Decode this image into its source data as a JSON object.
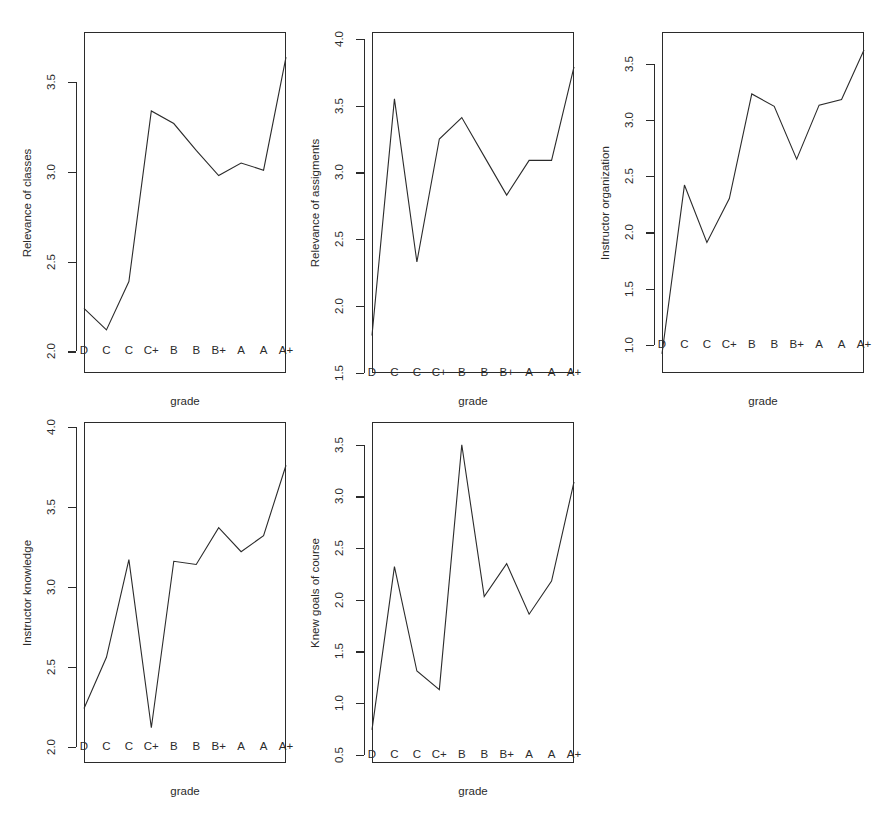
{
  "figure": {
    "background_color": "#ffffff",
    "line_color": "#2b2b2b",
    "axis_color": "#2b2b2b",
    "layout": "3 columns x 2 rows, 5 panels used, bottom-right empty"
  },
  "chart_data": [
    {
      "type": "line",
      "panel": 1,
      "title": "",
      "xlabel": "grade",
      "ylabel": "Relevance of classes",
      "categories": [
        "D",
        "C",
        "C",
        "C+",
        "B",
        "B",
        "B+",
        "A",
        "A",
        "A+"
      ],
      "values": [
        2.24,
        2.12,
        2.39,
        3.34,
        3.27,
        3.12,
        2.98,
        3.05,
        3.01,
        3.64
      ],
      "yticks": [
        "2.0",
        "2.5",
        "3.0",
        "3.5"
      ],
      "ytick_values": [
        2.0,
        2.5,
        3.0,
        3.5
      ],
      "ylim": [
        1.88,
        3.78
      ],
      "grid": false,
      "legend": "none"
    },
    {
      "type": "line",
      "panel": 2,
      "title": "",
      "xlabel": "grade",
      "ylabel": "Relevance of assigments",
      "categories": [
        "D",
        "C",
        "C",
        "C+",
        "B",
        "B",
        "B+",
        "A",
        "A",
        "A+"
      ],
      "values": [
        1.78,
        3.55,
        2.33,
        3.25,
        3.41,
        3.12,
        2.83,
        3.09,
        3.09,
        3.79
      ],
      "yticks": [
        "1.5",
        "2.0",
        "2.5",
        "3.0",
        "3.5",
        "4.0"
      ],
      "ytick_values": [
        1.5,
        2.0,
        2.5,
        3.0,
        3.5,
        4.0
      ],
      "ylim": [
        1.5,
        4.05
      ],
      "grid": false,
      "legend": "none"
    },
    {
      "type": "line",
      "panel": 3,
      "title": "",
      "xlabel": "grade",
      "ylabel": "Instructor organization",
      "categories": [
        "D",
        "C",
        "C",
        "C+",
        "B",
        "B",
        "B+",
        "A",
        "A",
        "A+"
      ],
      "values": [
        0.92,
        2.42,
        1.91,
        2.3,
        3.23,
        3.12,
        2.65,
        3.13,
        3.18,
        3.62
      ],
      "yticks": [
        "1.0",
        "1.5",
        "2.0",
        "2.5",
        "3.0",
        "3.5"
      ],
      "ytick_values": [
        1.0,
        1.5,
        2.0,
        2.5,
        3.0,
        3.5
      ],
      "ylim": [
        0.75,
        3.78
      ],
      "grid": false,
      "legend": "none"
    },
    {
      "type": "line",
      "panel": 4,
      "title": "",
      "xlabel": "grade",
      "ylabel": "Instructor knowledge",
      "categories": [
        "D",
        "C",
        "C",
        "C+",
        "B",
        "B",
        "B+",
        "A",
        "A",
        "A+"
      ],
      "values": [
        2.24,
        2.56,
        3.17,
        2.12,
        3.16,
        3.14,
        3.37,
        3.22,
        3.32,
        3.76
      ],
      "yticks": [
        "2.0",
        "2.5",
        "3.0",
        "3.5",
        "4.0"
      ],
      "ytick_values": [
        2.0,
        2.5,
        3.0,
        3.5,
        4.0
      ],
      "ylim": [
        1.9,
        4.03
      ],
      "grid": false,
      "legend": "none"
    },
    {
      "type": "line",
      "panel": 5,
      "title": "",
      "xlabel": "grade",
      "ylabel": "Knew goals of course",
      "categories": [
        "D",
        "C",
        "C",
        "C+",
        "B",
        "B",
        "B+",
        "A",
        "A",
        "A+"
      ],
      "values": [
        0.74,
        2.32,
        1.31,
        1.13,
        3.5,
        2.03,
        2.35,
        1.86,
        2.18,
        3.14
      ],
      "yticks": [
        "0.5",
        "1.0",
        "1.5",
        "2.0",
        "2.5",
        "3.0",
        "3.5"
      ],
      "ytick_values": [
        0.5,
        1.0,
        1.5,
        2.0,
        2.5,
        3.0,
        3.5
      ],
      "ylim": [
        0.42,
        3.72
      ],
      "grid": false,
      "legend": "none"
    }
  ]
}
